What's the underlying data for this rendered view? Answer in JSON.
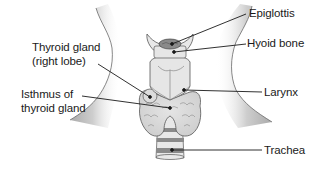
{
  "diagram": {
    "labels": {
      "epiglottis": "Epiglottis",
      "hyoid_bone": "Hyoid bone",
      "thyroid_right_lobe_line1": "Thyroid gland",
      "thyroid_right_lobe_line2": "(right lobe)",
      "larynx": "Larynx",
      "isthmus_line1": "Isthmus of",
      "isthmus_line2": "thyroid gland",
      "trachea": "Trachea"
    },
    "colors": {
      "background": "#ffffff",
      "neck_shadow": "#b8b8b8",
      "cartilage_fill": "#e6e6e6",
      "thyroid_fill": "#d9d9d9",
      "outline": "#555555",
      "dark_band": "#8a8a8a",
      "leader_line": "#1a1a1a",
      "text": "#1a1a1a"
    }
  }
}
